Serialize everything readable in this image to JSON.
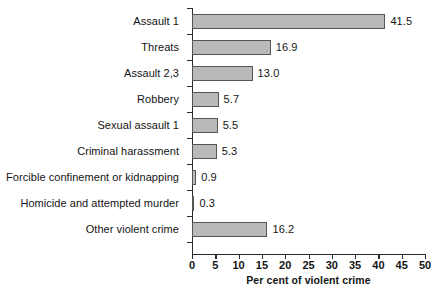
{
  "chart_data": {
    "type": "bar",
    "orientation": "horizontal",
    "title": "",
    "subtitle": "",
    "xlabel": "Per cent of violent crime",
    "ylabel": "",
    "xlim": [
      0,
      50
    ],
    "xticks": [
      0,
      5,
      10,
      15,
      20,
      25,
      30,
      35,
      40,
      45,
      50
    ],
    "xtick_labels": [
      "0",
      "5",
      "10",
      "15",
      "20",
      "25",
      "30",
      "35",
      "40",
      "45",
      "50"
    ],
    "grid": false,
    "legend": null,
    "categories": [
      "Assault 1",
      "Threats",
      "Assault 2,3",
      "Robbery",
      "Sexual assault 1",
      "Criminal harassment",
      "Forcible confinement or kidnapping",
      "Homicide and attempted murder",
      "Other violent crime"
    ],
    "values": [
      41.5,
      16.9,
      13.0,
      5.7,
      5.5,
      5.3,
      0.9,
      0.3,
      16.2
    ],
    "value_labels": [
      "41.5",
      "16.9",
      "13.0",
      "5.7",
      "5.5",
      "5.3",
      "0.9",
      "0.3",
      "16.2"
    ],
    "colors": {
      "bar_fill": "#b9b9b9",
      "bar_stroke": "#555555",
      "axis": "#2b2b2b",
      "text": "#141414",
      "background": "#ffffff"
    }
  }
}
